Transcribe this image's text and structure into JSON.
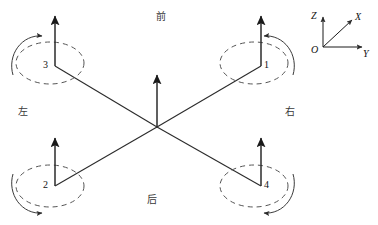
{
  "figure": {
    "background_color": "#ffffff",
    "stroke_color": "#2b2b2b",
    "dash_color": "#555555"
  },
  "orientation_labels": {
    "front": "前",
    "rear": "后",
    "left": "左",
    "right": "右"
  },
  "center_hub": {
    "thrust_arrow": "up",
    "x": 157,
    "y": 127
  },
  "rotors": [
    {
      "id": "1",
      "label": "1",
      "position": "top-right",
      "hub_x": 261,
      "hub_y": 66,
      "thrust_arrow": "up",
      "spin": "counter-clockwise",
      "arc_side": "right"
    },
    {
      "id": "2",
      "label": "2",
      "position": "bottom-left",
      "hub_x": 55,
      "hub_y": 186,
      "thrust_arrow": "up",
      "spin": "counter-clockwise",
      "arc_side": "left"
    },
    {
      "id": "3",
      "label": "3",
      "position": "top-left",
      "hub_x": 55,
      "hub_y": 66,
      "thrust_arrow": "up",
      "spin": "clockwise",
      "arc_side": "left"
    },
    {
      "id": "4",
      "label": "4",
      "position": "bottom-right",
      "hub_x": 261,
      "hub_y": 186,
      "thrust_arrow": "up",
      "spin": "clockwise",
      "arc_side": "right"
    }
  ],
  "coordinate_frame": {
    "origin_label": "O",
    "axes": [
      {
        "name": "Z",
        "label": "Z",
        "direction": "up"
      },
      {
        "name": "X",
        "label": "X",
        "direction": "up-right-diagonal"
      },
      {
        "name": "Y",
        "label": "Y",
        "direction": "right"
      }
    ]
  }
}
